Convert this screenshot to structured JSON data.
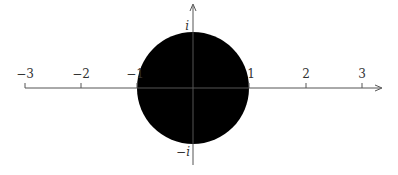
{
  "diagram": {
    "type": "complex-plane-unit-disk",
    "colors": {
      "axis": "#555555",
      "disk": "#000000",
      "text": "#333333",
      "background": "#ffffff"
    },
    "real_axis": {
      "tick_labels": [
        "−3",
        "−2",
        "−1",
        "1",
        "2",
        "3"
      ],
      "tick_values": [
        -3,
        -2,
        -1,
        1,
        2,
        3
      ],
      "arrow": "right"
    },
    "imaginary_axis": {
      "top_label": "i",
      "bottom_label": "−i",
      "arrow": "up"
    },
    "disk": {
      "center": [
        0,
        0
      ],
      "radius": 1,
      "fill": "solid"
    }
  }
}
